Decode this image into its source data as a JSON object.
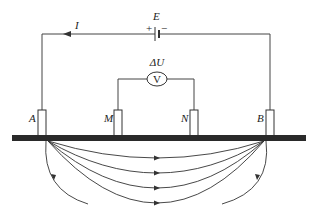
{
  "diagram": {
    "type": "electrical-resistivity-survey",
    "labels": {
      "current": "I",
      "emf": "E",
      "plus": "+",
      "minus": "−",
      "voltage_delta": "ΔU",
      "voltmeter": "V",
      "electrode_a": "A",
      "electrode_m": "M",
      "electrode_n": "N",
      "electrode_b": "B"
    },
    "electrodes": [
      {
        "name": "A",
        "x": 42
      },
      {
        "name": "M",
        "x": 118
      },
      {
        "name": "N",
        "x": 194
      },
      {
        "name": "B",
        "x": 270
      }
    ],
    "field_lines": {
      "count_between_AB": 4,
      "return_lines": 2,
      "direction": "A to B"
    },
    "colors": {
      "line": "#333333",
      "ground": "#2a2a2a",
      "background": "#ffffff"
    }
  }
}
